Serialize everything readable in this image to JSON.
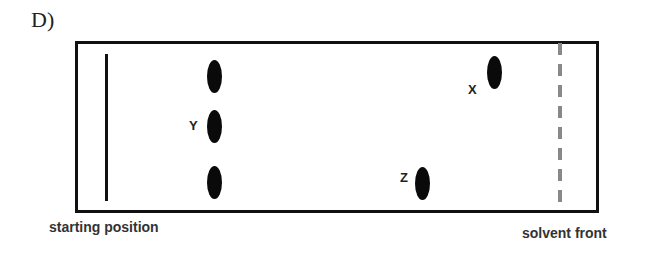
{
  "question_label": "D)",
  "diagram": {
    "captions": {
      "start": "starting position",
      "front": "solvent front"
    },
    "spots": [
      {
        "id": "ref-top",
        "label": "",
        "x": 214,
        "y": 76
      },
      {
        "id": "Y",
        "label": "Y",
        "x": 214,
        "y": 126
      },
      {
        "id": "ref-bottom",
        "label": "",
        "x": 214,
        "y": 182
      },
      {
        "id": "X",
        "label": "X",
        "x": 494,
        "y": 72
      },
      {
        "id": "Z",
        "label": "Z",
        "x": 422,
        "y": 183
      }
    ]
  }
}
